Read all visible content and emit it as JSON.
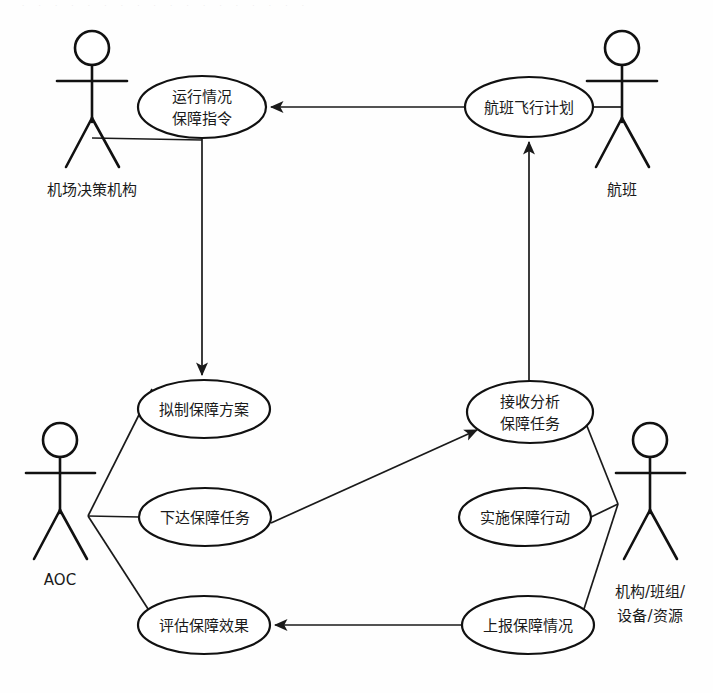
{
  "diagram": {
    "type": "uml-use-case-diagram",
    "canvas": {
      "width": 713,
      "height": 693
    },
    "colors": {
      "background": "#fefefe",
      "stroke": "#111111",
      "text": "#1a1a1a",
      "ellipse_fill": "#ffffff"
    },
    "scan_artifact": "· · · · · · · · · · · · · · · · · ·"
  },
  "actors": [
    {
      "id": "airport-decision-body",
      "label": "机场决策机构",
      "x": 92,
      "y": 58,
      "label_x": 92,
      "label_y": 190
    },
    {
      "id": "flight",
      "label": "航班",
      "x": 622,
      "y": 58,
      "label_x": 622,
      "label_y": 190
    },
    {
      "id": "aoc",
      "label": "AOC",
      "x": 60,
      "y": 448,
      "label_x": 60,
      "label_y": 580
    },
    {
      "id": "org-crew-equip-resource",
      "label_line1": "机构/班组/",
      "label_line2": "设备/资源",
      "x": 650,
      "y": 448,
      "label_x": 650,
      "label_y": 592
    }
  ],
  "use_cases": [
    {
      "id": "operation-status-command",
      "line1": "运行情况",
      "line2": "保障指令",
      "cx": 202,
      "cy": 107,
      "rx": 64,
      "ry": 31
    },
    {
      "id": "flight-plan",
      "line1": "航班飞行计划",
      "line2": "",
      "cx": 529,
      "cy": 107,
      "rx": 64,
      "ry": 30
    },
    {
      "id": "draft-support-plan",
      "line1": "拟制保障方案",
      "line2": "",
      "cx": 204,
      "cy": 409,
      "rx": 66,
      "ry": 29
    },
    {
      "id": "receive-analyze-task",
      "line1": "接收分析",
      "line2": "保障任务",
      "cx": 530,
      "cy": 412,
      "rx": 63,
      "ry": 31
    },
    {
      "id": "issue-support-task",
      "line1": "下达保障任务",
      "line2": "",
      "cx": 205,
      "cy": 517,
      "rx": 66,
      "ry": 29
    },
    {
      "id": "implement-support-action",
      "line1": "实施保障行动",
      "line2": "",
      "cx": 525,
      "cy": 517,
      "rx": 66,
      "ry": 29
    },
    {
      "id": "evaluate-support-effect",
      "line1": "评估保障效果",
      "line2": "",
      "cx": 204,
      "cy": 625,
      "rx": 66,
      "ry": 29
    },
    {
      "id": "report-support-status",
      "line1": "上报保障情况",
      "line2": "",
      "cx": 528,
      "cy": 625,
      "rx": 66,
      "ry": 29
    }
  ],
  "associations": [
    {
      "id": "assoc-decision-to-command",
      "from": "airport-decision-body",
      "to": "operation-status-command"
    },
    {
      "id": "assoc-flight-to-plan",
      "from": "flight",
      "to": "flight-plan"
    },
    {
      "id": "assoc-aoc-to-draft",
      "from": "aoc",
      "to": "draft-support-plan"
    },
    {
      "id": "assoc-aoc-to-issue",
      "from": "aoc",
      "to": "issue-support-task"
    },
    {
      "id": "assoc-aoc-to-evaluate",
      "from": "aoc",
      "to": "evaluate-support-effect"
    },
    {
      "id": "assoc-org-to-receive",
      "from": "org-crew-equip-resource",
      "to": "receive-analyze-task"
    },
    {
      "id": "assoc-org-to-implement",
      "from": "org-crew-equip-resource",
      "to": "implement-support-action"
    },
    {
      "id": "assoc-org-to-report",
      "from": "org-crew-equip-resource",
      "to": "report-support-status"
    }
  ],
  "flows": [
    {
      "id": "flow-plan-to-command",
      "from": "flight-plan",
      "to": "operation-status-command",
      "direction": "left"
    },
    {
      "id": "flow-command-to-draft",
      "from": "operation-status-command",
      "to": "draft-support-plan",
      "direction": "down"
    },
    {
      "id": "flow-receive-to-plan",
      "from": "receive-analyze-task",
      "to": "flight-plan",
      "direction": "up"
    },
    {
      "id": "flow-issue-to-receive",
      "from": "issue-support-task",
      "to": "receive-analyze-task",
      "direction": "up-right"
    },
    {
      "id": "flow-report-to-evaluate",
      "from": "report-support-status",
      "to": "evaluate-support-effect",
      "direction": "left"
    }
  ]
}
